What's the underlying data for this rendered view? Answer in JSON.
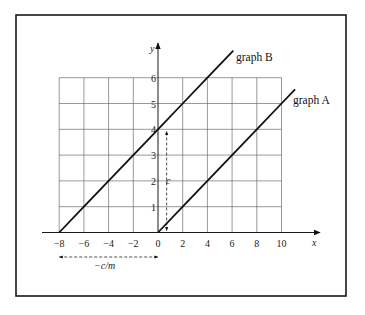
{
  "figure": {
    "graph_a_label": "graph A",
    "graph_b_label": "graph B",
    "x_axis_label": "x",
    "y_axis_label": "y",
    "intercept_label": "c",
    "x_intercept_label": "−c/m"
  },
  "chart_data": {
    "type": "line",
    "title": "",
    "xlabel": "x",
    "ylabel": "y",
    "xlim": [
      -8,
      10
    ],
    "ylim": [
      0,
      6
    ],
    "grid": true,
    "x_ticks": [
      -8,
      -6,
      -4,
      -2,
      0,
      2,
      4,
      6,
      8,
      10
    ],
    "x_tick_labels": [
      "−8",
      "−6",
      "−4",
      "−2",
      "0",
      "2",
      "4",
      "6",
      "8",
      "10"
    ],
    "y_ticks": [
      1,
      2,
      3,
      4,
      5,
      6
    ],
    "y_tick_labels": [
      "1",
      "2",
      "3",
      "4",
      "5",
      "6"
    ],
    "series": [
      {
        "name": "graph A",
        "equation": "y = 0.5x",
        "slope": 0.5,
        "intercept": 0,
        "x": [
          0,
          2,
          4,
          6,
          8,
          10,
          11.1
        ],
        "y": [
          0,
          1,
          2,
          3,
          4,
          5,
          5.55
        ]
      },
      {
        "name": "graph B",
        "equation": "y = 0.5x + 4",
        "slope": 0.5,
        "intercept": 4,
        "x": [
          -8,
          -6,
          -4,
          -2,
          0,
          2,
          4,
          6.1
        ],
        "y": [
          0,
          1,
          2,
          3,
          4,
          5,
          6,
          7.05
        ]
      }
    ],
    "annotations": [
      {
        "text": "c",
        "type": "vertical-double-arrow",
        "from": [
          0.7,
          0
        ],
        "to": [
          0.7,
          4
        ],
        "meaning": "y-intercept of graph B"
      },
      {
        "text": "−c/m",
        "type": "horizontal-double-arrow",
        "from": [
          -8,
          -1.0
        ],
        "to": [
          0,
          -1.0
        ],
        "meaning": "x-intercept of graph B"
      }
    ],
    "legend": "inline labels at line ends"
  }
}
